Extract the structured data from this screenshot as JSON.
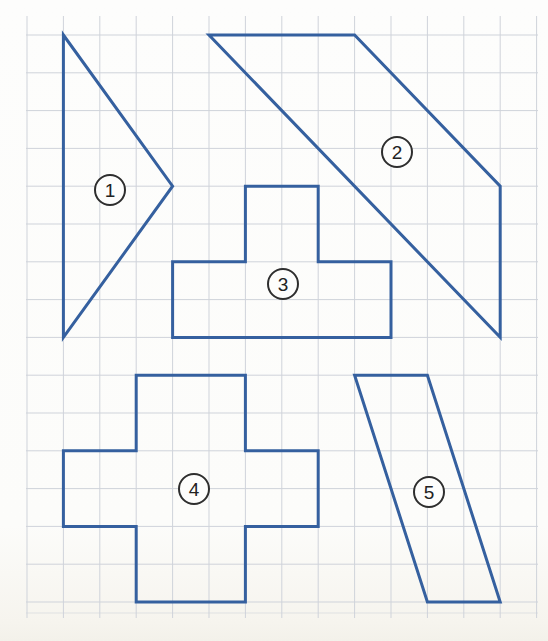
{
  "page": {
    "width": 548,
    "height": 641,
    "background": "#fcfcfa"
  },
  "grid": {
    "color": "#cfd3da",
    "stroke_width": 1,
    "x_lines": [
      27,
      63.4,
      99.8,
      136.2,
      172.6,
      209,
      245.4,
      281.8,
      318.2,
      354.6,
      391,
      427.4,
      463.8,
      500.2,
      536.6
    ],
    "y_lines": [
      35,
      72.8,
      110.6,
      148.4,
      186.2,
      224,
      261.8,
      299.6,
      337.4,
      375.2,
      413,
      450.8,
      488.6,
      526.4,
      564.2,
      602
    ],
    "vertical_line_top": 16,
    "vertical_line_bottom": 618,
    "horizontal_line_left": 26,
    "horizontal_line_right": 538,
    "bottom_edge_line_y": 613,
    "bottom_edge_line_opacity": 0.55
  },
  "shapes": {
    "stroke_color": "#35609f",
    "stroke_width": 3,
    "fill": "none",
    "items": [
      {
        "id": "1",
        "kind": "triangle",
        "label": "1",
        "label_center": [
          110,
          190
        ],
        "points": [
          [
            63.4,
            35
          ],
          [
            172.6,
            186.2
          ],
          [
            63.4,
            337.4
          ]
        ]
      },
      {
        "id": "2",
        "kind": "quadrilateral-band",
        "label": "2",
        "label_center": [
          397,
          152
        ],
        "points": [
          [
            209,
            35
          ],
          [
            354.6,
            35
          ],
          [
            500.2,
            186.2
          ],
          [
            500.2,
            337.4
          ]
        ]
      },
      {
        "id": "3",
        "kind": "t-shape",
        "label": "3",
        "label_center": [
          283,
          284
        ],
        "points": [
          [
            245.4,
            186.2
          ],
          [
            318.2,
            186.2
          ],
          [
            318.2,
            261.8
          ],
          [
            391,
            261.8
          ],
          [
            391,
            337.4
          ],
          [
            172.6,
            337.4
          ],
          [
            172.6,
            261.8
          ],
          [
            245.4,
            261.8
          ]
        ]
      },
      {
        "id": "4",
        "kind": "cross",
        "label": "4",
        "label_center": [
          194,
          489
        ],
        "points": [
          [
            136.2,
            375.2
          ],
          [
            245.4,
            375.2
          ],
          [
            245.4,
            450.8
          ],
          [
            318.2,
            450.8
          ],
          [
            318.2,
            526.4
          ],
          [
            245.4,
            526.4
          ],
          [
            245.4,
            602
          ],
          [
            136.2,
            602
          ],
          [
            136.2,
            526.4
          ],
          [
            63.4,
            526.4
          ],
          [
            63.4,
            450.8
          ],
          [
            136.2,
            450.8
          ]
        ]
      },
      {
        "id": "5",
        "kind": "parallelogram",
        "label": "5",
        "label_center": [
          429,
          492
        ],
        "points": [
          [
            354.6,
            375.2
          ],
          [
            427.4,
            375.2
          ],
          [
            500.2,
            602
          ],
          [
            427.4,
            602
          ]
        ]
      }
    ]
  },
  "labels": {
    "circle_stroke": "#2e2e2e",
    "circle_stroke_width": 2,
    "circle_fill": "#fdfdfc",
    "radius": 15,
    "font_size": 19,
    "text_color": "#222222"
  }
}
